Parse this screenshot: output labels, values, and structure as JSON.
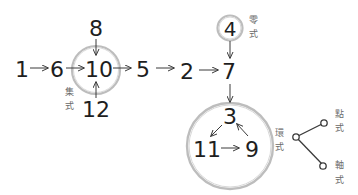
{
  "diagram": {
    "nodes": {
      "n1": "1",
      "n6": "6",
      "n10": "10",
      "n8": "8",
      "n12": "12",
      "n5": "5",
      "n2": "2",
      "n7": "7",
      "n4": "4",
      "n3": "3",
      "n11": "11",
      "n9": "9"
    },
    "labels": {
      "converging_1": "集",
      "converging_2": "式",
      "zero_1": "零",
      "zero_2": "式",
      "cycle_1": "環",
      "cycle_2": "式",
      "point_1": "點",
      "point_2": "式",
      "axis_1": "軸",
      "axis_2": "式"
    },
    "edges": [
      {
        "from": "1",
        "to": "6"
      },
      {
        "from": "6",
        "to": "10"
      },
      {
        "from": "8",
        "to": "10"
      },
      {
        "from": "12",
        "to": "10"
      },
      {
        "from": "10",
        "to": "5"
      },
      {
        "from": "5",
        "to": "2"
      },
      {
        "from": "2",
        "to": "7"
      },
      {
        "from": "4",
        "to": "7"
      },
      {
        "from": "7",
        "to": "3"
      },
      {
        "from": "3",
        "to": "11"
      },
      {
        "from": "11",
        "to": "9"
      },
      {
        "from": "9",
        "to": "3"
      }
    ],
    "colors": {
      "text": "#1e1e1e",
      "label": "#6a6a6a",
      "ring": "#bdbdbd",
      "arrow": "#3a3a3a"
    }
  }
}
